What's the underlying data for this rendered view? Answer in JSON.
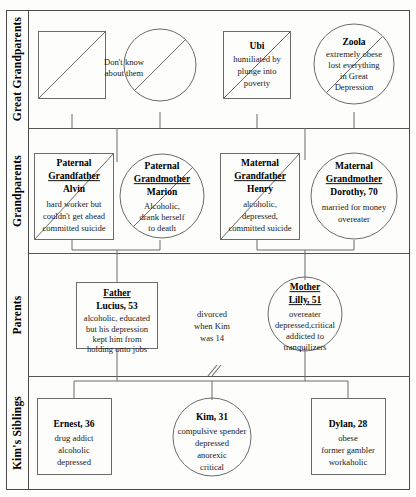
{
  "diagram": {
    "type": "genogram",
    "row_labels": [
      "Great Grandparents",
      "Grandparents",
      "Parents",
      "Kim's Siblings"
    ],
    "annotations": [
      {
        "id": "unknown-note",
        "text_lines": [
          "Don't know",
          "about them"
        ]
      },
      {
        "id": "divorce-note",
        "text_lines": [
          "divorced",
          "when Kim",
          "was 14"
        ]
      }
    ],
    "generations": [
      {
        "id": "great-grandparents",
        "label": "Great Grandparents",
        "people": [
          {
            "id": "ggf-unknown",
            "shape": "square",
            "gender": "male",
            "deceased": true,
            "name": "",
            "desc_lines": []
          },
          {
            "id": "ggm-unknown",
            "shape": "circle",
            "gender": "female",
            "deceased": true,
            "name": "",
            "desc_lines": []
          },
          {
            "id": "ubi",
            "shape": "square",
            "gender": "male",
            "deceased": true,
            "name": "Ubi",
            "name_underlined": false,
            "desc_lines": [
              "humiliated by",
              "plunge into",
              "poverty"
            ]
          },
          {
            "id": "zoola",
            "shape": "circle",
            "gender": "female",
            "deceased": true,
            "name": "Zoola",
            "name_underlined": false,
            "desc_lines": [
              "extremely obese",
              "lost everything",
              "in Great",
              "Depression"
            ]
          }
        ]
      },
      {
        "id": "grandparents",
        "label": "Grandparents",
        "people": [
          {
            "id": "paternal-grandfather-alvin",
            "shape": "square",
            "gender": "male",
            "deceased": true,
            "title_lines": [
              "Paternal",
              "Grandfather"
            ],
            "name": "Alvin",
            "desc_lines": [
              "hard worker but",
              "couldn't get ahead",
              "committed suicide"
            ]
          },
          {
            "id": "paternal-grandmother-marion",
            "shape": "circle",
            "gender": "female",
            "deceased": true,
            "title_lines": [
              "Paternal",
              "Grandmother"
            ],
            "name": "Marion",
            "desc_lines": [
              "Alcoholic,",
              "drank herself",
              "to death"
            ]
          },
          {
            "id": "maternal-grandfather-henry",
            "shape": "square",
            "gender": "male",
            "deceased": true,
            "title_lines": [
              "Maternal",
              "Grandfather"
            ],
            "name": "Henry",
            "desc_lines": [
              "alcoholic,",
              "depressed,",
              "committed suicide"
            ]
          },
          {
            "id": "maternal-grandmother-dorothy",
            "shape": "circle",
            "gender": "female",
            "deceased": false,
            "title_lines": [
              "Maternal",
              "Grandmother"
            ],
            "name": "Dorothy, 70",
            "desc_lines": [
              "married for money",
              "overeater"
            ]
          }
        ]
      },
      {
        "id": "parents",
        "label": "Parents",
        "people": [
          {
            "id": "father-lucius",
            "shape": "square",
            "gender": "male",
            "deceased": false,
            "title_lines": [
              "Father"
            ],
            "name": "Lucius, 53",
            "desc_lines": [
              "alcoholic, educated",
              "but his depression",
              "kept him from",
              "holding onto jobs"
            ]
          },
          {
            "id": "mother-lilly",
            "shape": "circle",
            "gender": "female",
            "deceased": false,
            "title_lines": [
              "Mother"
            ],
            "name": "Lilly, 51",
            "desc_lines": [
              "overeater",
              "depressed,critical",
              "addicted to",
              "tranquilizers"
            ]
          }
        ]
      },
      {
        "id": "kims-siblings",
        "label": "Kim's Siblings",
        "people": [
          {
            "id": "ernest",
            "shape": "square",
            "gender": "male",
            "deceased": false,
            "name": "Ernest, 36",
            "desc_lines": [
              "drug addict",
              "alcoholic",
              "depressed"
            ]
          },
          {
            "id": "kim",
            "shape": "circle",
            "gender": "female",
            "deceased": false,
            "name": "Kim, 31",
            "desc_lines": [
              "compulsive spender",
              "depressed",
              "anorexic",
              "critical"
            ]
          },
          {
            "id": "dylan",
            "shape": "square",
            "gender": "male",
            "deceased": false,
            "name": "Dylan, 28",
            "desc_lines": [
              "obese",
              "former gambler",
              "workaholic"
            ]
          }
        ]
      }
    ],
    "colors": {
      "stroke": "#6b6b6b",
      "frame": "#4a4a4a",
      "text": "#000000",
      "background": "#fdfdfc"
    }
  }
}
